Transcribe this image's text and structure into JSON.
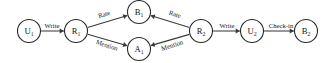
{
  "diagram": {
    "background_color": "#ffffff",
    "node_stroke_color": "#2b2b2b",
    "edge_color": "#3a3a3a",
    "text_color": "#161616",
    "nodes": [
      {
        "id": "U1",
        "base": "U",
        "sub": "1",
        "type": "user",
        "x": 29,
        "y": 31,
        "r": 11.5
      },
      {
        "id": "R1",
        "base": "R",
        "sub": "1",
        "type": "review",
        "x": 76,
        "y": 31,
        "r": 11.5
      },
      {
        "id": "B1",
        "base": "B",
        "sub": "1",
        "type": "business",
        "x": 139,
        "y": 12,
        "r": 11.5
      },
      {
        "id": "A1",
        "base": "A",
        "sub": "1",
        "type": "aspect",
        "x": 139,
        "y": 49,
        "r": 11.5
      },
      {
        "id": "R2",
        "base": "R",
        "sub": "2",
        "type": "review",
        "x": 201,
        "y": 31,
        "r": 11.5
      },
      {
        "id": "U2",
        "base": "U",
        "sub": "2",
        "type": "user",
        "x": 252,
        "y": 31,
        "r": 11.5
      },
      {
        "id": "B2",
        "base": "B",
        "sub": "2",
        "type": "business",
        "x": 306,
        "y": 31,
        "r": 11.5
      }
    ],
    "edges": [
      {
        "id": "e1",
        "from": "U1",
        "to": "R1",
        "label": "Write",
        "label_x": 52,
        "label_y": 25,
        "rotate": 0,
        "directed": true
      },
      {
        "id": "e2",
        "from": "R1",
        "to": "B1",
        "label": "Rate",
        "label_x": 104,
        "label_y": 14,
        "rotate": -18,
        "directed": true
      },
      {
        "id": "e3",
        "from": "R1",
        "to": "A1",
        "label": "Mention",
        "label_x": 107,
        "label_y": 45,
        "rotate": 18,
        "directed": true
      },
      {
        "id": "e4",
        "from": "R2",
        "to": "B1",
        "label": "Rate",
        "label_x": 175,
        "label_y": 14,
        "rotate": 18,
        "directed": true
      },
      {
        "id": "e5",
        "from": "R2",
        "to": "A1",
        "label": "Mention",
        "label_x": 172,
        "label_y": 45,
        "rotate": -18,
        "directed": true
      },
      {
        "id": "e6",
        "from": "R2",
        "to": "U2",
        "label": "Write",
        "label_x": 227,
        "label_y": 25,
        "rotate": 0,
        "directed": true
      },
      {
        "id": "e7",
        "from": "U2",
        "to": "B2",
        "label": "Check-in",
        "label_x": 281,
        "label_y": 25,
        "rotate": 0,
        "directed": true
      }
    ]
  }
}
